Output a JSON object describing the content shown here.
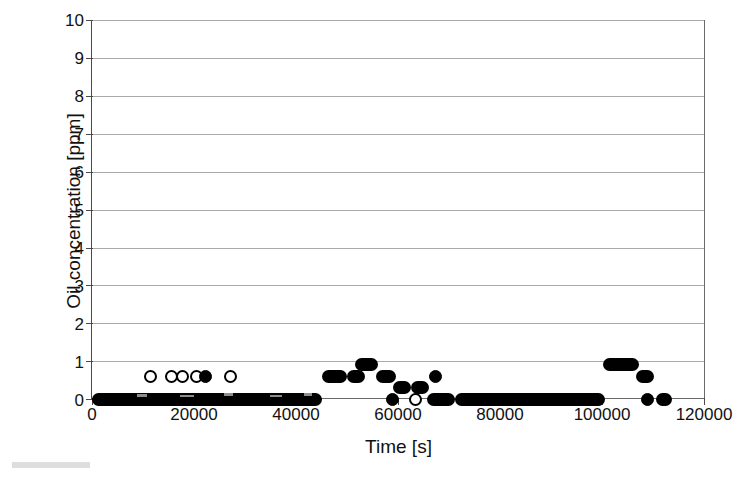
{
  "chart_data": {
    "type": "scatter",
    "title": "",
    "xlabel": "Time [s]",
    "ylabel": "Oil concentration [ppm]",
    "xlim": [
      0,
      120000
    ],
    "ylim": [
      0,
      10
    ],
    "xticks": [
      0,
      20000,
      40000,
      60000,
      80000,
      100000,
      120000
    ],
    "xticklabels": [
      "0",
      "20000",
      "40000",
      "60000",
      "80000",
      "100000",
      "120000"
    ],
    "yticks": [
      0,
      1,
      2,
      3,
      4,
      5,
      6,
      7,
      8,
      9,
      10
    ],
    "yticklabels": [
      "0",
      "1",
      "2",
      "3",
      "4",
      "5",
      "6",
      "7",
      "8",
      "9",
      "10"
    ],
    "grid": "horizontal",
    "legend": "none",
    "marker": "circle",
    "marker_color": "#000000",
    "series": [
      {
        "name": "Oil concentration",
        "description": "Dense time series sampled continuously; values are quantised to 0, 0.3, 0.6, 0.9 ppm. Long stretches sit at 0 ppm with isolated excursions.",
        "runs": [
          {
            "x_start": 0,
            "x_end": 45000,
            "y": 0
          },
          {
            "x_start": 45000,
            "x_end": 50000,
            "y": 0.6
          },
          {
            "x_start": 50000,
            "x_end": 53500,
            "y": 0.6
          },
          {
            "x_start": 51500,
            "x_end": 56000,
            "y": 0.9
          },
          {
            "x_start": 55500,
            "x_end": 59500,
            "y": 0.6
          },
          {
            "x_start": 59000,
            "x_end": 62500,
            "y": 0.3
          },
          {
            "x_start": 62500,
            "x_end": 66000,
            "y": 0.3
          },
          {
            "x_start": 65500,
            "x_end": 71000,
            "y": 0
          },
          {
            "x_start": 71000,
            "x_end": 100500,
            "y": 0
          },
          {
            "x_start": 100000,
            "x_end": 107000,
            "y": 0.9
          },
          {
            "x_start": 106500,
            "x_end": 110000,
            "y": 0.6
          },
          {
            "x_start": 110500,
            "x_end": 113500,
            "y": 0
          }
        ],
        "points": [
          {
            "x": 11500,
            "y": 0.6,
            "marker": "open"
          },
          {
            "x": 15500,
            "y": 0.6,
            "marker": "open"
          },
          {
            "x": 17700,
            "y": 0.6,
            "marker": "open"
          },
          {
            "x": 20500,
            "y": 0.6,
            "marker": "open"
          },
          {
            "x": 22200,
            "y": 0.6,
            "marker": "filled"
          },
          {
            "x": 27200,
            "y": 0.6,
            "marker": "open"
          },
          {
            "x": 58800,
            "y": 0,
            "marker": "filled"
          },
          {
            "x": 63400,
            "y": 0,
            "marker": "open"
          },
          {
            "x": 67200,
            "y": 0.6,
            "marker": "filled"
          },
          {
            "x": 108700,
            "y": 0,
            "marker": "filled"
          }
        ]
      }
    ]
  }
}
